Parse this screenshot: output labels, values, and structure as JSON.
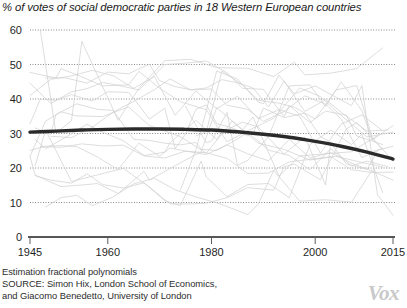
{
  "chart_data": {
    "type": "line",
    "title": "% of votes of social democratic parties in 18 Western European countries",
    "xlabel": "",
    "ylabel": "",
    "xlim": [
      1945,
      2015
    ],
    "ylim": [
      0,
      60
    ],
    "grid": true,
    "legend_position": "none",
    "x_ticks": [
      "1945",
      "1960",
      "1980",
      "2000",
      "2015"
    ],
    "x_tick_values": [
      1945,
      1960,
      1980,
      2000,
      2015
    ],
    "y_ticks": [
      "0",
      "10",
      "20",
      "30",
      "40",
      "50",
      "60"
    ],
    "y_tick_values": [
      0,
      10,
      20,
      30,
      40,
      50,
      60
    ],
    "annotation": "Estimation fractional polynomials",
    "series": [
      {
        "name": "Fractional polynomial fit (18-country trend)",
        "style": "thick-dark",
        "color": "#2a2a2a",
        "x": [
          1945,
          1950,
          1955,
          1960,
          1965,
          1970,
          1975,
          1980,
          1985,
          1990,
          1995,
          2000,
          2005,
          2010,
          2015
        ],
        "values": [
          30.4,
          30.7,
          31.0,
          31.2,
          31.3,
          31.3,
          31.2,
          31.0,
          30.5,
          29.8,
          28.9,
          27.7,
          26.3,
          24.6,
          22.6
        ]
      },
      {
        "name": "Austria",
        "style": "thin-light",
        "color": "#cfcfcf",
        "x": [
          1945,
          1949,
          1953,
          1956,
          1959,
          1962,
          1966,
          1970,
          1971,
          1975,
          1979,
          1983,
          1986,
          1990,
          1994,
          1995,
          1999,
          2002,
          2006,
          2008,
          2013
        ],
        "values": [
          44.6,
          38.7,
          42.1,
          43.0,
          44.8,
          44.0,
          42.6,
          48.4,
          50.0,
          50.4,
          51.0,
          47.6,
          43.1,
          42.8,
          34.9,
          38.1,
          33.2,
          36.5,
          35.3,
          29.3,
          26.8
        ]
      },
      {
        "name": "Belgium",
        "style": "thin-light",
        "color": "#cfcfcf",
        "x": [
          1946,
          1949,
          1950,
          1954,
          1958,
          1961,
          1965,
          1968,
          1971,
          1974,
          1977,
          1978,
          1981,
          1985,
          1987,
          1991,
          1995,
          1999,
          2003,
          2007,
          2010,
          2014
        ],
        "values": [
          31.6,
          29.8,
          35.5,
          38.6,
          37.0,
          36.7,
          28.3,
          28.0,
          27.2,
          26.7,
          27.4,
          25.4,
          25.1,
          28.4,
          30.4,
          25.2,
          23.6,
          19.5,
          25.6,
          20.6,
          22.0,
          20.4
        ]
      },
      {
        "name": "Denmark",
        "style": "thin-light",
        "color": "#cfcfcf",
        "x": [
          1945,
          1947,
          1950,
          1953,
          1957,
          1960,
          1964,
          1966,
          1968,
          1971,
          1973,
          1975,
          1977,
          1979,
          1981,
          1984,
          1987,
          1988,
          1990,
          1994,
          1998,
          2001,
          2005,
          2007,
          2011,
          2015
        ],
        "values": [
          32.8,
          40.0,
          39.6,
          41.3,
          39.4,
          42.1,
          41.9,
          38.2,
          34.2,
          37.3,
          25.6,
          29.9,
          37.0,
          38.3,
          32.9,
          31.6,
          29.3,
          29.8,
          37.4,
          34.6,
          35.9,
          29.1,
          25.8,
          25.5,
          24.8,
          26.3
        ]
      },
      {
        "name": "Finland",
        "style": "thin-light",
        "color": "#cfcfcf",
        "x": [
          1945,
          1948,
          1951,
          1954,
          1958,
          1962,
          1966,
          1970,
          1972,
          1975,
          1979,
          1983,
          1987,
          1991,
          1995,
          1999,
          2003,
          2007,
          2011,
          2015
        ],
        "values": [
          25.1,
          26.3,
          26.5,
          26.2,
          23.2,
          19.5,
          27.2,
          23.4,
          25.8,
          24.9,
          23.9,
          26.7,
          24.1,
          22.1,
          28.3,
          22.9,
          24.5,
          21.4,
          19.1,
          16.5
        ]
      },
      {
        "name": "France",
        "style": "thin-light",
        "color": "#cfcfcf",
        "x": [
          1945,
          1946,
          1951,
          1956,
          1958,
          1962,
          1967,
          1968,
          1973,
          1978,
          1981,
          1986,
          1988,
          1993,
          1997,
          2002,
          2007,
          2012
        ],
        "values": [
          23.4,
          17.9,
          14.6,
          15.2,
          15.5,
          12.6,
          19.0,
          16.5,
          20.7,
          24.7,
          37.5,
          31.0,
          34.8,
          17.6,
          23.5,
          24.1,
          24.7,
          29.4
        ]
      },
      {
        "name": "Germany",
        "style": "thin-light",
        "color": "#cfcfcf",
        "x": [
          1949,
          1953,
          1957,
          1961,
          1965,
          1969,
          1972,
          1976,
          1980,
          1983,
          1987,
          1990,
          1994,
          1998,
          2002,
          2005,
          2009,
          2013
        ],
        "values": [
          29.2,
          28.8,
          31.8,
          36.2,
          39.3,
          42.7,
          45.8,
          42.6,
          42.9,
          38.2,
          37.0,
          33.5,
          36.4,
          40.9,
          38.5,
          34.2,
          23.0,
          25.7
        ]
      },
      {
        "name": "Greece",
        "style": "thin-light",
        "color": "#cfcfcf",
        "x": [
          1974,
          1977,
          1981,
          1985,
          1989,
          1990,
          1993,
          1996,
          2000,
          2004,
          2007,
          2009,
          2012,
          2015
        ],
        "values": [
          13.6,
          25.3,
          48.1,
          45.8,
          39.1,
          38.6,
          46.9,
          41.5,
          43.8,
          40.5,
          38.1,
          43.9,
          12.3,
          6.3
        ]
      },
      {
        "name": "Iceland",
        "style": "thin-light",
        "color": "#cfcfcf",
        "x": [
          1946,
          1949,
          1953,
          1956,
          1959,
          1963,
          1967,
          1971,
          1974,
          1978,
          1979,
          1983,
          1987,
          1991,
          1995,
          1999,
          2003,
          2007,
          2009,
          2013
        ],
        "values": [
          17.8,
          16.5,
          15.6,
          18.3,
          15.2,
          14.2,
          15.7,
          10.5,
          9.1,
          22.0,
          17.4,
          11.7,
          15.2,
          15.5,
          11.4,
          26.8,
          31.0,
          26.8,
          29.8,
          12.9
        ]
      },
      {
        "name": "Ireland",
        "style": "thin-light",
        "color": "#cfcfcf",
        "x": [
          1948,
          1951,
          1954,
          1957,
          1961,
          1965,
          1969,
          1973,
          1977,
          1981,
          1982,
          1987,
          1989,
          1992,
          1997,
          2002,
          2007,
          2011,
          2016
        ],
        "values": [
          8.7,
          11.4,
          12.1,
          9.1,
          11.6,
          15.4,
          17.0,
          13.7,
          11.6,
          9.9,
          9.4,
          6.5,
          9.5,
          19.3,
          10.4,
          10.8,
          10.1,
          19.4,
          6.6
        ]
      },
      {
        "name": "Italy",
        "style": "thin-light",
        "color": "#cfcfcf",
        "x": [
          1946,
          1948,
          1953,
          1958,
          1963,
          1968,
          1972,
          1976,
          1979,
          1983,
          1987,
          1992,
          1994,
          1996,
          2001,
          2006,
          2008,
          2013
        ],
        "values": [
          20.7,
          31.0,
          16.1,
          18.0,
          19.9,
          14.5,
          9.6,
          9.6,
          9.8,
          11.4,
          14.3,
          13.6,
          20.4,
          21.1,
          16.6,
          31.3,
          33.2,
          25.4
        ]
      },
      {
        "name": "Luxembourg",
        "style": "thin-light",
        "color": "#cfcfcf",
        "x": [
          1945,
          1948,
          1951,
          1954,
          1959,
          1964,
          1968,
          1974,
          1979,
          1984,
          1989,
          1994,
          1999,
          2004,
          2009,
          2013
        ],
        "values": [
          23.4,
          33.6,
          36.3,
          35.1,
          34.9,
          37.7,
          32.3,
          29.1,
          24.3,
          33.6,
          27.2,
          25.4,
          22.3,
          23.4,
          21.6,
          20.3
        ]
      },
      {
        "name": "Malta",
        "style": "thin-light",
        "color": "#cfcfcf",
        "x": [
          1947,
          1950,
          1951,
          1953,
          1955,
          1962,
          1966,
          1971,
          1976,
          1981,
          1987,
          1992,
          1996,
          1998,
          2003,
          2008,
          2013
        ],
        "values": [
          59.9,
          30.1,
          31.3,
          33.7,
          56.7,
          33.8,
          43.1,
          51.1,
          51.5,
          49.1,
          48.9,
          46.5,
          50.7,
          47.0,
          47.5,
          48.8,
          54.8
        ]
      },
      {
        "name": "Netherlands",
        "style": "thin-light",
        "color": "#cfcfcf",
        "x": [
          1946,
          1948,
          1952,
          1956,
          1959,
          1963,
          1967,
          1971,
          1972,
          1977,
          1981,
          1982,
          1986,
          1989,
          1994,
          1998,
          2002,
          2003,
          2006,
          2010,
          2012
        ],
        "values": [
          28.3,
          25.6,
          29.0,
          32.7,
          30.4,
          27.9,
          23.6,
          24.6,
          27.3,
          33.8,
          28.3,
          30.4,
          33.3,
          31.9,
          24.0,
          29.0,
          15.1,
          27.3,
          21.2,
          19.6,
          24.8
        ]
      },
      {
        "name": "Norway",
        "style": "thin-light",
        "color": "#cfcfcf",
        "x": [
          1945,
          1949,
          1953,
          1957,
          1961,
          1965,
          1969,
          1973,
          1977,
          1981,
          1985,
          1989,
          1993,
          1997,
          2001,
          2005,
          2009,
          2013
        ],
        "values": [
          41.0,
          45.7,
          46.7,
          48.3,
          46.8,
          43.1,
          46.5,
          35.3,
          42.3,
          37.2,
          40.8,
          34.3,
          36.9,
          35.0,
          24.3,
          32.7,
          35.4,
          30.8
        ]
      },
      {
        "name": "Portugal",
        "style": "thin-light",
        "color": "#cfcfcf",
        "x": [
          1975,
          1976,
          1979,
          1980,
          1983,
          1985,
          1987,
          1991,
          1995,
          1999,
          2002,
          2005,
          2009,
          2011,
          2015
        ],
        "values": [
          37.9,
          35.0,
          27.3,
          27.8,
          36.1,
          20.8,
          22.2,
          29.1,
          43.8,
          44.1,
          37.8,
          45.0,
          36.6,
          28.1,
          32.3
        ]
      },
      {
        "name": "Spain",
        "style": "thin-light",
        "color": "#cfcfcf",
        "x": [
          1977,
          1979,
          1982,
          1986,
          1989,
          1993,
          1996,
          2000,
          2004,
          2008,
          2011,
          2015
        ],
        "values": [
          29.3,
          30.5,
          48.1,
          44.1,
          39.6,
          38.8,
          37.6,
          34.2,
          42.6,
          43.9,
          28.8,
          22.0
        ]
      },
      {
        "name": "Sweden",
        "style": "thin-light",
        "color": "#cfcfcf",
        "x": [
          1948,
          1952,
          1956,
          1958,
          1960,
          1964,
          1968,
          1970,
          1973,
          1976,
          1979,
          1982,
          1985,
          1988,
          1991,
          1994,
          1998,
          2002,
          2006,
          2010,
          2014
        ],
        "values": [
          46.1,
          46.1,
          44.6,
          46.2,
          47.8,
          47.3,
          50.1,
          45.3,
          43.6,
          42.7,
          43.2,
          45.6,
          44.7,
          43.2,
          37.7,
          45.2,
          36.4,
          39.8,
          35.0,
          30.7,
          31.0
        ]
      },
      {
        "name": "Switzerland",
        "style": "thin-light",
        "color": "#cfcfcf",
        "x": [
          1947,
          1951,
          1955,
          1959,
          1963,
          1967,
          1971,
          1975,
          1979,
          1983,
          1987,
          1991,
          1995,
          1999,
          2003,
          2007,
          2011,
          2015
        ],
        "values": [
          26.2,
          26.0,
          27.0,
          26.4,
          26.6,
          23.5,
          22.9,
          24.9,
          24.4,
          22.8,
          18.4,
          18.5,
          21.8,
          22.5,
          23.3,
          19.5,
          18.7,
          18.8
        ]
      },
      {
        "name": "United Kingdom",
        "style": "thin-light",
        "color": "#cfcfcf",
        "x": [
          1945,
          1950,
          1951,
          1955,
          1959,
          1964,
          1966,
          1970,
          1974,
          1979,
          1983,
          1987,
          1992,
          1997,
          2001,
          2005,
          2010,
          2015
        ],
        "values": [
          47.7,
          46.1,
          48.8,
          46.4,
          43.8,
          44.1,
          48.0,
          43.1,
          39.2,
          36.9,
          27.6,
          30.8,
          34.4,
          43.2,
          40.7,
          35.2,
          29.0,
          30.4
        ]
      }
    ]
  },
  "footer": {
    "line1": "Estimation fractional polynomials",
    "line2": "SOURCE: Simon Hix, London School of Economics,",
    "line3": "and Giacomo Benedetto, University of London"
  },
  "branding": {
    "logo_text": "Vox"
  }
}
